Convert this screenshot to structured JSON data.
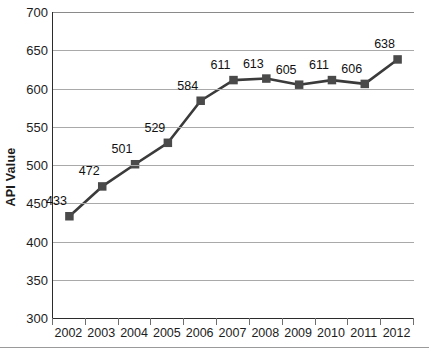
{
  "chart_data": {
    "type": "line",
    "title": "",
    "xlabel": "",
    "ylabel": "API Value",
    "ylim": [
      300,
      700
    ],
    "ytick_step": 50,
    "yticks": [
      700,
      650,
      600,
      550,
      500,
      450,
      400,
      350,
      300
    ],
    "grid": true,
    "legend": false,
    "categories": [
      "2002",
      "2003",
      "2004",
      "2005",
      "2006",
      "2007",
      "2008",
      "2009",
      "2010",
      "2011",
      "2012"
    ],
    "values": [
      433,
      472,
      501,
      529,
      584,
      611,
      613,
      605,
      611,
      606,
      638
    ],
    "point_labels": [
      "433",
      "472",
      "501",
      "529",
      "584",
      "611",
      "613",
      "605",
      "611",
      "606",
      "638"
    ],
    "series": [
      {
        "name": "API Value",
        "values": [
          433,
          472,
          501,
          529,
          584,
          611,
          613,
          605,
          611,
          606,
          638
        ]
      }
    ]
  },
  "colors": {
    "series_line": "#3b3b3b",
    "marker": "#4a4a4a",
    "gridline": "#a9a9a9",
    "axis": "#2b2b2b",
    "text": "#1c1c1c",
    "background": "#ffffff"
  }
}
